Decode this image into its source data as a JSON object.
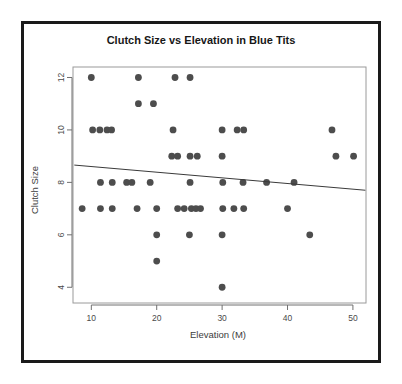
{
  "chart_data": {
    "type": "scatter",
    "title": "Clutch Size vs Elevation in Blue Tits",
    "xlabel": "Elevation (M)",
    "ylabel": "Clutch Size",
    "xlim": [
      7.2,
      52.0
    ],
    "ylim": [
      3.4,
      12.4
    ],
    "xticks": [
      10,
      20,
      30,
      40,
      50
    ],
    "yticks": [
      4,
      6,
      8,
      10,
      12
    ],
    "xtick_labels": [
      "10",
      "20",
      "30",
      "40",
      "50"
    ],
    "ytick_labels": [
      "4",
      "6",
      "8",
      "10",
      "12"
    ],
    "grid": false,
    "legend": null,
    "marker": "filled-circle",
    "marker_color": "#4d4d4d",
    "points": [
      {
        "x": 10.0,
        "y": 12
      },
      {
        "x": 17.2,
        "y": 12
      },
      {
        "x": 22.8,
        "y": 12
      },
      {
        "x": 25.1,
        "y": 12
      },
      {
        "x": 17.2,
        "y": 11
      },
      {
        "x": 19.5,
        "y": 11
      },
      {
        "x": 10.2,
        "y": 10
      },
      {
        "x": 11.3,
        "y": 10
      },
      {
        "x": 12.4,
        "y": 10
      },
      {
        "x": 13.1,
        "y": 10
      },
      {
        "x": 22.5,
        "y": 10
      },
      {
        "x": 30.0,
        "y": 10
      },
      {
        "x": 32.3,
        "y": 10
      },
      {
        "x": 33.3,
        "y": 10
      },
      {
        "x": 46.8,
        "y": 10
      },
      {
        "x": 22.3,
        "y": 9
      },
      {
        "x": 23.2,
        "y": 9
      },
      {
        "x": 25.1,
        "y": 9
      },
      {
        "x": 26.2,
        "y": 9
      },
      {
        "x": 30.0,
        "y": 9
      },
      {
        "x": 47.4,
        "y": 9
      },
      {
        "x": 50.1,
        "y": 9
      },
      {
        "x": 11.4,
        "y": 8
      },
      {
        "x": 13.2,
        "y": 8
      },
      {
        "x": 15.4,
        "y": 8
      },
      {
        "x": 16.2,
        "y": 8
      },
      {
        "x": 19.0,
        "y": 8
      },
      {
        "x": 25.1,
        "y": 8
      },
      {
        "x": 30.1,
        "y": 8
      },
      {
        "x": 33.2,
        "y": 8
      },
      {
        "x": 36.8,
        "y": 8
      },
      {
        "x": 41.0,
        "y": 8
      },
      {
        "x": 8.6,
        "y": 7
      },
      {
        "x": 11.4,
        "y": 7
      },
      {
        "x": 13.2,
        "y": 7
      },
      {
        "x": 17.0,
        "y": 7
      },
      {
        "x": 20.0,
        "y": 7
      },
      {
        "x": 23.2,
        "y": 7
      },
      {
        "x": 24.2,
        "y": 7
      },
      {
        "x": 25.3,
        "y": 7
      },
      {
        "x": 26.0,
        "y": 7
      },
      {
        "x": 26.7,
        "y": 7
      },
      {
        "x": 30.1,
        "y": 7
      },
      {
        "x": 31.8,
        "y": 7
      },
      {
        "x": 33.3,
        "y": 7
      },
      {
        "x": 40.0,
        "y": 7
      },
      {
        "x": 20.0,
        "y": 6
      },
      {
        "x": 25.0,
        "y": 6
      },
      {
        "x": 30.0,
        "y": 6
      },
      {
        "x": 43.4,
        "y": 6
      },
      {
        "x": 20.0,
        "y": 5
      },
      {
        "x": 30.0,
        "y": 4
      }
    ],
    "fit_line": {
      "name": "regression-line",
      "x_start": 7.4,
      "y_start": 8.66,
      "x_end": 51.9,
      "y_end": 7.7
    }
  },
  "figure": {
    "background_color": "#ffffff",
    "frame_color": "#1a1a1a",
    "panel_border_color": "#9a9a9a",
    "axis_color": "#707070"
  }
}
